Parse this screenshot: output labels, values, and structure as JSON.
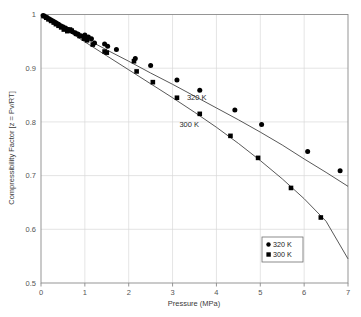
{
  "chart_data": {
    "type": "scatter",
    "title": "",
    "xlabel": "Pressure (MPa)",
    "ylabel": "Compressibility Factor [z = Pv/RT]",
    "xlim": [
      0,
      7
    ],
    "ylim": [
      0.5,
      1.0
    ],
    "xticks": [
      "0",
      "1",
      "2",
      "3",
      "4",
      "5",
      "6",
      "7"
    ],
    "xtick_values": [
      0,
      1,
      2,
      3,
      4,
      5,
      6,
      7
    ],
    "yticks": [
      "0.5",
      "0.6",
      "0.7",
      "0.8",
      "0.9",
      "1"
    ],
    "ytick_values": [
      0.5,
      0.6,
      0.7,
      0.8,
      0.9,
      1.0
    ],
    "grid": true,
    "grid_color": "#d9d9d9",
    "axis_color": "#8a8a8a",
    "marker_color": "#000000",
    "line_color": "#3a3a3a",
    "legend_position": "lower-right",
    "annotations": [
      {
        "text": "320 K",
        "x": 3.55,
        "y": 0.84,
        "name": "curve-label-320k"
      },
      {
        "text": "300 K",
        "x": 3.38,
        "y": 0.79,
        "name": "curve-label-300k"
      }
    ],
    "series": [
      {
        "name": "320 K",
        "marker": "circle",
        "legend_label": "320 K",
        "points": [
          [
            0.05,
            0.998
          ],
          [
            0.1,
            0.996
          ],
          [
            0.14,
            0.994
          ],
          [
            0.18,
            0.992
          ],
          [
            0.22,
            0.99
          ],
          [
            0.27,
            0.988
          ],
          [
            0.31,
            0.986
          ],
          [
            0.35,
            0.984
          ],
          [
            0.4,
            0.982
          ],
          [
            0.45,
            0.979
          ],
          [
            0.5,
            0.977
          ],
          [
            0.56,
            0.975
          ],
          [
            0.62,
            0.972
          ],
          [
            0.68,
            0.97
          ],
          [
            0.72,
            0.968
          ],
          [
            0.78,
            0.966
          ],
          [
            0.85,
            0.963
          ],
          [
            0.92,
            0.96
          ],
          [
            1.0,
            0.962
          ],
          [
            1.08,
            0.958
          ],
          [
            1.15,
            0.955
          ],
          [
            1.22,
            0.947
          ],
          [
            1.45,
            0.945
          ],
          [
            1.52,
            0.941
          ],
          [
            1.72,
            0.935
          ],
          [
            2.15,
            0.918
          ],
          [
            2.5,
            0.905
          ],
          [
            3.1,
            0.878
          ],
          [
            3.62,
            0.859
          ],
          [
            4.42,
            0.822
          ],
          [
            5.03,
            0.795
          ],
          [
            6.08,
            0.745
          ],
          [
            6.82,
            0.709
          ]
        ],
        "fit_curve": [
          [
            0.0,
            1.0
          ],
          [
            0.5,
            0.978
          ],
          [
            1.0,
            0.956
          ],
          [
            1.5,
            0.934
          ],
          [
            2.0,
            0.913
          ],
          [
            2.5,
            0.891
          ],
          [
            3.0,
            0.87
          ],
          [
            3.5,
            0.848
          ],
          [
            4.0,
            0.826
          ],
          [
            4.5,
            0.804
          ],
          [
            5.0,
            0.781
          ],
          [
            5.5,
            0.757
          ],
          [
            6.0,
            0.731
          ],
          [
            6.5,
            0.706
          ],
          [
            7.0,
            0.68
          ]
        ]
      },
      {
        "name": "300 K",
        "marker": "square",
        "legend_label": "300 K",
        "points": [
          [
            0.06,
            0.997
          ],
          [
            0.12,
            0.994
          ],
          [
            0.17,
            0.991
          ],
          [
            0.23,
            0.988
          ],
          [
            0.29,
            0.985
          ],
          [
            0.34,
            0.982
          ],
          [
            0.4,
            0.979
          ],
          [
            0.46,
            0.976
          ],
          [
            0.52,
            0.972
          ],
          [
            0.6,
            0.969
          ],
          [
            0.66,
            0.972
          ],
          [
            0.7,
            0.97
          ],
          [
            0.8,
            0.964
          ],
          [
            0.88,
            0.96
          ],
          [
            0.98,
            0.955
          ],
          [
            1.05,
            0.952
          ],
          [
            1.18,
            0.944
          ],
          [
            1.45,
            0.931
          ],
          [
            1.5,
            0.929
          ],
          [
            2.12,
            0.913
          ],
          [
            2.18,
            0.894
          ],
          [
            2.55,
            0.874
          ],
          [
            3.1,
            0.845
          ],
          [
            3.62,
            0.815
          ],
          [
            4.32,
            0.774
          ],
          [
            4.95,
            0.733
          ],
          [
            5.7,
            0.677
          ],
          [
            6.38,
            0.622
          ]
        ],
        "fit_curve": [
          [
            0.0,
            1.0
          ],
          [
            0.5,
            0.975
          ],
          [
            1.0,
            0.949
          ],
          [
            1.5,
            0.923
          ],
          [
            2.0,
            0.897
          ],
          [
            2.5,
            0.871
          ],
          [
            3.0,
            0.845
          ],
          [
            3.5,
            0.818
          ],
          [
            4.0,
            0.79
          ],
          [
            4.5,
            0.76
          ],
          [
            5.0,
            0.728
          ],
          [
            5.5,
            0.694
          ],
          [
            6.0,
            0.657
          ],
          [
            6.5,
            0.615
          ],
          [
            7.0,
            0.545
          ]
        ]
      }
    ]
  },
  "legend": {
    "entries": [
      {
        "label": "320 K",
        "marker": "circle"
      },
      {
        "label": "300 K",
        "marker": "square"
      }
    ]
  }
}
